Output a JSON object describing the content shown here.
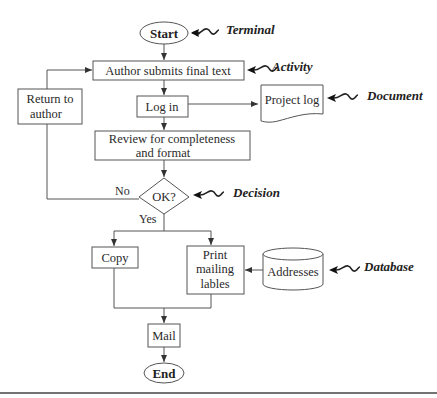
{
  "diagram": {
    "type": "flowchart",
    "nodes": {
      "start": {
        "label": "Start",
        "shape": "terminal"
      },
      "author_submits": {
        "label": "Author submits final text",
        "shape": "activity"
      },
      "log_in": {
        "label": "Log in",
        "shape": "activity"
      },
      "project_log": {
        "label": "Project log",
        "shape": "document"
      },
      "review": {
        "line1": "Review for completeness",
        "line2": "and format",
        "shape": "activity"
      },
      "return_to_author": {
        "line1": "Return to",
        "line2": "author",
        "shape": "activity"
      },
      "ok": {
        "label": "OK?",
        "shape": "decision"
      },
      "copy": {
        "label": "Copy",
        "shape": "activity"
      },
      "print": {
        "line1": "Print",
        "line2": "mailing",
        "line3": "lables",
        "shape": "activity"
      },
      "addresses": {
        "label": "Addresses",
        "shape": "database"
      },
      "mail": {
        "label": "Mail",
        "shape": "activity"
      },
      "end": {
        "label": "End",
        "shape": "terminal"
      }
    },
    "edge_labels": {
      "no": "No",
      "yes": "Yes"
    },
    "annotations": {
      "terminal": "Terminal",
      "activity": "Activity",
      "document": "Document",
      "decision": "Decision",
      "database": "Database"
    },
    "edges": [
      {
        "from": "start",
        "to": "author_submits"
      },
      {
        "from": "author_submits",
        "to": "log_in"
      },
      {
        "from": "log_in",
        "to": "project_log"
      },
      {
        "from": "log_in",
        "to": "review"
      },
      {
        "from": "review",
        "to": "ok"
      },
      {
        "from": "ok",
        "to": "return_to_author",
        "label": "No"
      },
      {
        "from": "return_to_author",
        "to": "author_submits"
      },
      {
        "from": "ok",
        "to": "copy",
        "label": "Yes"
      },
      {
        "from": "ok",
        "to": "print",
        "label": "Yes"
      },
      {
        "from": "addresses",
        "to": "print"
      },
      {
        "from": "copy",
        "to": "mail"
      },
      {
        "from": "print",
        "to": "mail"
      },
      {
        "from": "mail",
        "to": "end"
      }
    ]
  }
}
